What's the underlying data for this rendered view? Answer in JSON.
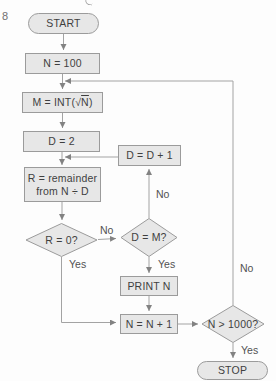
{
  "page": {
    "number": "8"
  },
  "colors": {
    "node_fill": "#e7e7e7",
    "node_border": "#9b9b9b",
    "wire": "#a3a3a3",
    "arrowhead": "#828282",
    "node_text": "#3f3f3f",
    "edge_label_text": "#525252"
  },
  "flowchart": {
    "nodes": {
      "start": {
        "label": "START"
      },
      "init_n": {
        "label": "N = 100"
      },
      "compute_m": {
        "prefix": "M = INT(√",
        "radicand": "N",
        "suffix": ")"
      },
      "init_d": {
        "label": "D = 2"
      },
      "remainder": {
        "line1": "R = remainder",
        "line2": "from N ÷ D"
      },
      "increment_d": {
        "label": "D = D + 1"
      },
      "check_r": {
        "label": "R = 0?"
      },
      "check_d": {
        "label": "D = M?"
      },
      "print_n": {
        "label": "PRINT N"
      },
      "increment_n": {
        "label": "N = N + 1"
      },
      "check_limit": {
        "label": "N > 1000?"
      },
      "stop": {
        "label": "STOP"
      }
    },
    "edge_labels": {
      "check_r_no": "No",
      "check_r_yes": "Yes",
      "check_d_no": "No",
      "check_d_yes": "Yes",
      "check_limit_no": "No",
      "check_limit_yes": "Yes"
    }
  }
}
